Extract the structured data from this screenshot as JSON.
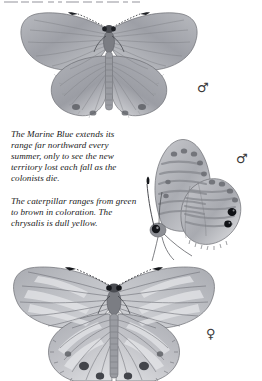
{
  "page": {
    "kind": "field-guide-plate",
    "subject": "Marine Blue",
    "background_color": "#ffffff",
    "ink_color": "#1a1a1a",
    "illustration_tone": "grayscale"
  },
  "captions": [
    {
      "id": "range-note",
      "text": "The Marine Blue extends its range far northward every summer, only to see the new territory lost each fall as the colonists die."
    },
    {
      "id": "larva-note",
      "text": "The caterpillar ranges from green to brown in coloration. The chrysalis is dull yellow."
    }
  ],
  "symbols": {
    "male": "♂",
    "female": "♀"
  },
  "plates": [
    {
      "id": "male-upperside",
      "label": "♂",
      "view": "upperside",
      "sex": "male",
      "description": "Spread-wing dorsal view, plain grey-blue wings with radiating veins and dark marginal spots on hindwing."
    },
    {
      "id": "male-underside",
      "label": "♂",
      "view": "underside",
      "sex": "male",
      "description": "Lateral closed-wing view, banded grey striping with two black eyespots near hindwing margin."
    },
    {
      "id": "female-upperside",
      "label": "♀",
      "view": "upperside",
      "sex": "female",
      "description": "Spread-wing dorsal view, mottled pale banding with dark submarginal spots, lower wing edges cropped by page bottom."
    }
  ]
}
